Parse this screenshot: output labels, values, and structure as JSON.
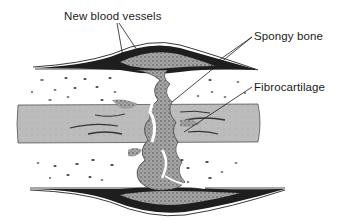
{
  "figure": {
    "colors": {
      "background": "#ffffff",
      "cortex": "#ffffff",
      "marrow": "#bdbdbd",
      "callus_dark": "#1e1e1e",
      "callus_stipple": "#8f8f8f",
      "line": "#1a1a1a"
    }
  },
  "labels": [
    {
      "id": "new-blood-vessels",
      "text": "New blood vessels"
    },
    {
      "id": "spongy-bone",
      "text": "Spongy bone"
    },
    {
      "id": "fibrocartilage",
      "text": "Fibrocartilage"
    }
  ]
}
